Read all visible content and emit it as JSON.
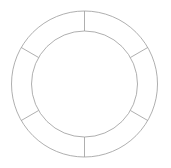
{
  "figure": {
    "kind": "annulus-with-radial-dividers",
    "background_color": "#ffffff",
    "canvas": {
      "width": 171,
      "height": 168
    }
  },
  "geometry": {
    "center_x": 84.5,
    "center_y": 84,
    "outer_radius": 73,
    "inner_radius": 53,
    "band_width": 20,
    "segment_count": 6,
    "segment_angle_degrees": 60,
    "start_angle_degrees": 0
  },
  "style": {
    "stroke_color": "#9a9a9a",
    "stroke_width": 0.8,
    "fill_color": "none"
  },
  "rings": [
    {
      "name": "outer-ring",
      "radius": 73,
      "stroke_color": "#9a9a9a",
      "stroke_width": 0.8
    },
    {
      "name": "inner-ring",
      "radius": 53,
      "stroke_color": "#9a9a9a",
      "stroke_width": 0.8
    }
  ],
  "spokes": [
    {
      "name": "spoke-0",
      "angle_degrees": 0,
      "clock_position": "12 o'clock"
    },
    {
      "name": "spoke-1",
      "angle_degrees": 60,
      "clock_position": "2 o'clock"
    },
    {
      "name": "spoke-2",
      "angle_degrees": 120,
      "clock_position": "4 o'clock"
    },
    {
      "name": "spoke-3",
      "angle_degrees": 180,
      "clock_position": "6 o'clock"
    },
    {
      "name": "spoke-4",
      "angle_degrees": 240,
      "clock_position": "8 o'clock"
    },
    {
      "name": "spoke-5",
      "angle_degrees": 300,
      "clock_position": "10 o'clock"
    }
  ],
  "segments": [
    {
      "name": "segment-1",
      "start_angle_degrees": 0,
      "end_angle_degrees": 60,
      "label": ""
    },
    {
      "name": "segment-2",
      "start_angle_degrees": 60,
      "end_angle_degrees": 120,
      "label": ""
    },
    {
      "name": "segment-3",
      "start_angle_degrees": 120,
      "end_angle_degrees": 180,
      "label": ""
    },
    {
      "name": "segment-4",
      "start_angle_degrees": 180,
      "end_angle_degrees": 240,
      "label": ""
    },
    {
      "name": "segment-5",
      "start_angle_degrees": 240,
      "end_angle_degrees": 300,
      "label": ""
    },
    {
      "name": "segment-6",
      "start_angle_degrees": 300,
      "end_angle_degrees": 360,
      "label": ""
    }
  ]
}
